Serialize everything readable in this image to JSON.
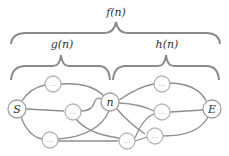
{
  "diagram": {
    "labels": {
      "f": "f(n)",
      "g": "g(n)",
      "h": "h(n)"
    },
    "nodes": {
      "start": "S",
      "current": "n",
      "end": "E",
      "intermediate": "…"
    },
    "colors": {
      "brace": "#8a8a8a",
      "edge": "#8e8e8e",
      "node_border": "#b4b4b4",
      "text": "#333333",
      "dots": "#9a9a9a"
    }
  }
}
